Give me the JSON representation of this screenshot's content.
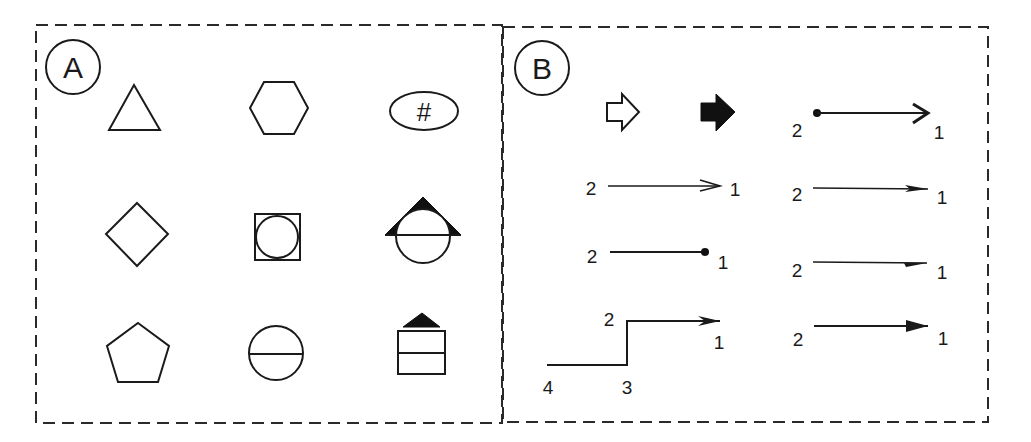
{
  "colors": {
    "ink": "#1a1a1a",
    "background": "#ffffff"
  },
  "panels": {
    "a": {
      "label": "A",
      "shapes": [
        {
          "name": "triangle"
        },
        {
          "name": "hexagon"
        },
        {
          "name": "ellipse-with-hash",
          "text": "#"
        },
        {
          "name": "diamond"
        },
        {
          "name": "square-with-inscribed-circle"
        },
        {
          "name": "circle-with-line-and-triangle-roof"
        },
        {
          "name": "pentagon"
        },
        {
          "name": "circle-with-horizontal-line"
        },
        {
          "name": "box-with-divider-and-triangle-roof"
        }
      ]
    },
    "b": {
      "label": "B",
      "connectors": [
        {
          "name": "outline-block-arrow"
        },
        {
          "name": "filled-block-arrow"
        },
        {
          "name": "dot-to-open-arrow",
          "start": "2",
          "end": "1"
        },
        {
          "name": "open-arrow-line",
          "start": "2",
          "end": "1"
        },
        {
          "name": "line-arrow",
          "start": "2",
          "end": "1"
        },
        {
          "name": "line-to-dot",
          "start": "2",
          "end": "1"
        },
        {
          "name": "half-arrow-line",
          "start": "2",
          "end": "1"
        },
        {
          "name": "stepped-connector",
          "p1": "1",
          "p2": "2",
          "p3": "3",
          "p4": "4"
        },
        {
          "name": "filled-arrow-line",
          "start": "2",
          "end": "1"
        }
      ]
    }
  }
}
